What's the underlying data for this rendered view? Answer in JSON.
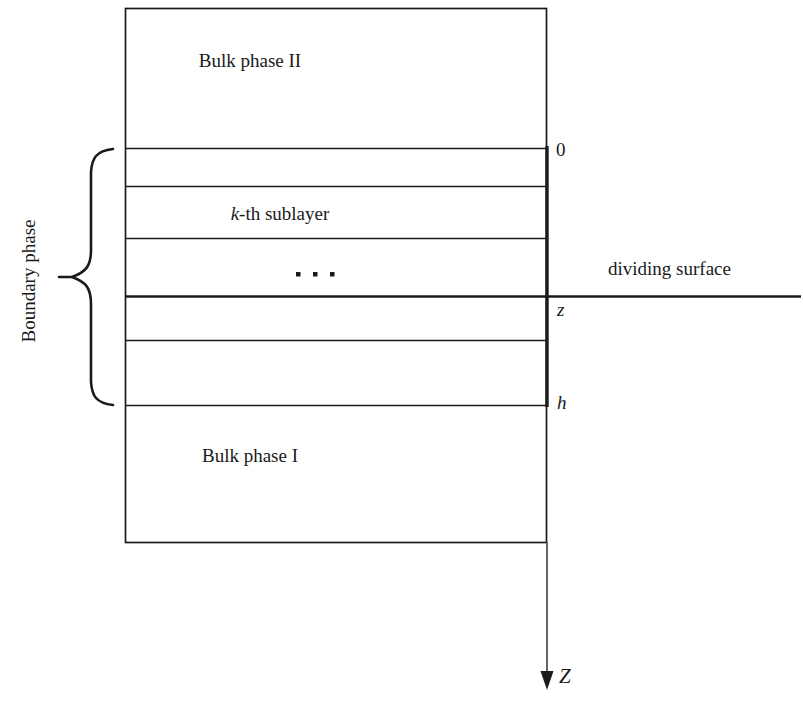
{
  "diagram": {
    "type": "schematic",
    "colors": {
      "line": "#1a1a1a",
      "background": "#ffffff",
      "text": "#1a1a1a"
    },
    "regions": {
      "bulk_phase_upper": "Bulk phase II",
      "bulk_phase_lower": "Bulk phase I",
      "sublayer_label_italic": "k",
      "sublayer_label_rest": "-th sublayer",
      "ellipsis": "· · ·",
      "boundary_brace": "Boundary phase"
    },
    "annotations": {
      "dividing_surface": "dividing surface"
    },
    "axis": {
      "name": "Z",
      "direction": "downward",
      "ticks": [
        {
          "label": "0",
          "meaning": "top of boundary phase"
        },
        {
          "label": "z",
          "meaning": "position of dividing surface"
        },
        {
          "label": "h",
          "meaning": "bottom of boundary phase"
        }
      ]
    },
    "geometry": {
      "box_left": 125,
      "box_right": 547,
      "box_top": 8,
      "box_bottom": 542,
      "divider_y": [
        148,
        186,
        238,
        296,
        340,
        405
      ],
      "thick_divider_y": 296,
      "brace_top": 148,
      "brace_bottom": 405,
      "axis_arrow_tip_y": 688
    }
  }
}
